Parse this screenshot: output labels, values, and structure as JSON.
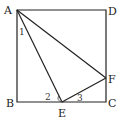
{
  "figure": {
    "type": "geometry",
    "points": {
      "A": {
        "label": "A",
        "x": 17,
        "y": 10
      },
      "B": {
        "label": "B",
        "x": 17,
        "y": 102
      },
      "C": {
        "label": "C",
        "x": 106,
        "y": 102
      },
      "D": {
        "label": "D",
        "x": 106,
        "y": 10
      },
      "E": {
        "label": "E",
        "x": 62,
        "y": 102
      },
      "F": {
        "label": "F",
        "x": 106,
        "y": 78
      }
    },
    "angles": {
      "angle1": "1",
      "angle2": "2",
      "angle3": "3"
    },
    "segments": [
      "AB",
      "BC",
      "CD",
      "DA",
      "AE",
      "AF",
      "EF"
    ],
    "line_color": "#222222"
  }
}
